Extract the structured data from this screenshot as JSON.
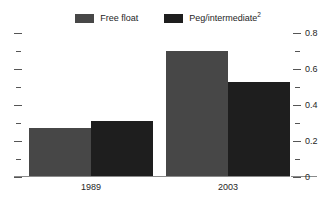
{
  "legend": {
    "entries": [
      {
        "label": "Free float",
        "swatch_name": "legend-swatch-free-float",
        "color": "#474747"
      },
      {
        "label": "Peg/intermediate",
        "footnote": "2",
        "swatch_name": "legend-swatch-peg-intermediate",
        "color": "#1e1e1e"
      }
    ]
  },
  "chart_data": {
    "type": "bar",
    "title": "",
    "subtitle": "",
    "xlabel": "",
    "ylabel": "",
    "categories": [
      "1989",
      "2003"
    ],
    "series": [
      {
        "name": "Free float",
        "color": "#474747",
        "values": [
          0.27,
          0.7
        ]
      },
      {
        "name": "Peg/intermediate",
        "color": "#1e1e1e",
        "values": [
          0.31,
          0.53
        ]
      }
    ],
    "ylim": [
      0,
      0.8
    ],
    "y_axis": {
      "side": "right",
      "major_ticks": [
        0,
        0.2,
        0.4,
        0.6,
        0.8
      ],
      "major_tick_labels": [
        "0",
        "0.2",
        "0.4",
        "0.6",
        "0.8"
      ],
      "minor_ticks": [
        0.1,
        0.3,
        0.5,
        0.7
      ],
      "mirrored_left_axis_unlabeled": true
    },
    "grid": false,
    "legend_position": "top-center"
  },
  "colors": {
    "background": "#ffffff",
    "text": "#262626",
    "axis": "#8a8a8a",
    "tick": "#555555",
    "series_free_float": "#474747",
    "series_peg_intermediate": "#1e1e1e"
  }
}
